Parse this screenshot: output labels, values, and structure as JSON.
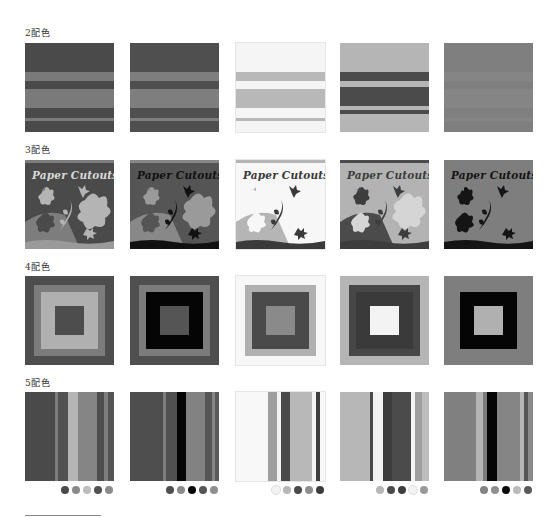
{
  "sections": [
    {
      "label": "2配色",
      "type": "horizontal-stripes"
    },
    {
      "label": "3配色",
      "type": "paper-cutouts"
    },
    {
      "label": "4配色",
      "type": "nested-squares"
    },
    {
      "label": "5配色",
      "type": "vertical-stripes"
    }
  ],
  "cutout_title": "Paper Cutouts",
  "two_color": [
    {
      "bg": "#4a4a4a",
      "stripe": "#7a7a7a"
    },
    {
      "bg": "#4f4f4f",
      "stripe": "#7e7e7e"
    },
    {
      "bg": "#f5f5f5",
      "stripe": "#b8b8b8"
    },
    {
      "bg": "#b5b5b5",
      "stripe": "#4b4b4b"
    },
    {
      "bg": "#7f7f7f",
      "stripe": "#858585"
    }
  ],
  "three_color": [
    {
      "bg": "#4a4a4a",
      "mid": "#7d7d7d",
      "light": "#b4b4b4",
      "title": "#d8d8d8",
      "ground": "#9a9a9a"
    },
    {
      "bg": "#555555",
      "mid": "#888888",
      "light": "#9a9a9a",
      "title": "#111111",
      "ground": "#111111"
    },
    {
      "bg": "#f7f7f7",
      "mid": "#b5b5b5",
      "light": "#f7f7f7",
      "title": "#3a3a3a",
      "ground": "#3a3a3a"
    },
    {
      "bg": "#b3b3b3",
      "mid": "#4b4b4b",
      "light": "#d5d5d5",
      "title": "#3d3d3d",
      "ground": "#3d3d3d"
    },
    {
      "bg": "#7e7e7e",
      "mid": "#7e7e7e",
      "light": "#7e7e7e",
      "title": "#151515",
      "ground": "#151515"
    }
  ],
  "four_color": [
    {
      "outer": "#4d4d4d",
      "ring": "#7c7c7c",
      "inner": "#b0b0b0",
      "center": "#4d4d4d"
    },
    {
      "outer": "#4f4f4f",
      "ring": "#7c7c7c",
      "inner": "#050505",
      "center": "#555555"
    },
    {
      "outer": "#f7f7f7",
      "ring": "#b0b0b0",
      "inner": "#4a4a4a",
      "center": "#8a8a8a"
    },
    {
      "outer": "#b5b5b5",
      "ring": "#474747",
      "inner": "#3a3a3a",
      "center": "#f3f3f3"
    },
    {
      "outer": "#7e7e7e",
      "ring": "#7e7e7e",
      "inner": "#050505",
      "center": "#b0b0b0"
    }
  ],
  "five_color": [
    {
      "bands": [
        [
          "#4a4a4a",
          30
        ],
        [
          "#7c7c7c",
          3
        ],
        [
          "#525252",
          10
        ],
        [
          "#b5b5b5",
          10
        ],
        [
          "#858585",
          19
        ],
        [
          "#4e4e4e",
          7
        ],
        [
          "#7e7e7e",
          4
        ],
        [
          "#555555",
          6
        ]
      ],
      "dots": [
        "#4a4a4a",
        "#8a8a8a",
        "#bdbdbd",
        "#525252",
        "#8c8c8c"
      ]
    },
    {
      "bands": [
        [
          "#4e4e4e",
          33
        ],
        [
          "#7e7e7e",
          3
        ],
        [
          "#505050",
          11
        ],
        [
          "#050505",
          9
        ],
        [
          "#828282",
          19
        ],
        [
          "#555555",
          7
        ],
        [
          "#858585",
          3
        ],
        [
          "#5a5a5a",
          4
        ]
      ],
      "dots": [
        "#505050",
        "#8a8a8a",
        "#080808",
        "#555555",
        "#8e8e8e"
      ]
    },
    {
      "bands": [
        [
          "#f8f8f8",
          32
        ],
        [
          "#9e9e9e",
          9
        ],
        [
          "#f3f3f3",
          4
        ],
        [
          "#4a4a4a",
          9
        ],
        [
          "#b8b8b8",
          22
        ],
        [
          "#f4f4f4",
          4
        ],
        [
          "#3e3e3e",
          4
        ],
        [
          "#f8f8f8",
          5
        ]
      ],
      "dots": [
        "#f2f2f2",
        "#b7b7b7",
        "#4a4a4a",
        "#8f8f8f",
        "#3d3d3d"
      ]
    },
    {
      "bands": [
        [
          "#b7b7b7",
          30
        ],
        [
          "#4a4a4a",
          3
        ],
        [
          "#f3f3f3",
          10
        ],
        [
          "#3d3d3d",
          9
        ],
        [
          "#4b4b4b",
          19
        ],
        [
          "#f3f3f3",
          4
        ],
        [
          "#9e9e9e",
          7
        ],
        [
          "#bdbdbd",
          7
        ]
      ],
      "dots": [
        "#b7b7b7",
        "#4a4a4a",
        "#3d3d3d",
        "#f2f2f2",
        "#9a9a9a"
      ]
    },
    {
      "bands": [
        [
          "#808080",
          32
        ],
        [
          "#b5b5b5",
          7
        ],
        [
          "#7c7c7c",
          4
        ],
        [
          "#060606",
          10
        ],
        [
          "#858585",
          23
        ],
        [
          "#b6b6b6",
          4
        ],
        [
          "#555555",
          4
        ],
        [
          "#8a8a8a",
          5
        ]
      ],
      "dots": [
        "#838383",
        "#8f8f8f",
        "#0a0a0a",
        "#bbbbbb",
        "#5a5a5a"
      ]
    }
  ],
  "tile_positions_x": [
    25,
    130,
    236,
    340,
    444
  ]
}
